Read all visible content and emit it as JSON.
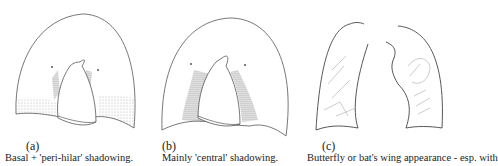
{
  "figure": {
    "panels": [
      {
        "label": "(a)",
        "caption": "Basal + 'peri-hilar' shadowing."
      },
      {
        "label": "(b)",
        "caption": "Mainly 'central' shadowing."
      },
      {
        "label": "(c)",
        "caption": "Butterfly or bat's wing appearance - esp. with"
      }
    ],
    "line_color": "#555555",
    "shade_color": "#777777"
  }
}
